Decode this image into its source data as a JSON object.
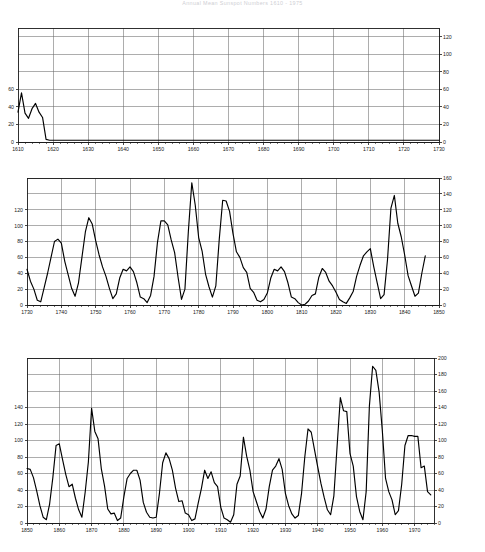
{
  "title": "Annual Mean Sunspot Numbers 1610 - 1975",
  "chart_data": [
    {
      "id": "panel-1",
      "type": "line",
      "title": "",
      "xlabel": "",
      "ylabel": "",
      "xlim": [
        1610,
        1730
      ],
      "ylim": [
        0,
        130
      ],
      "grid": true,
      "legend": null,
      "x_ticks": [
        1610,
        1620,
        1630,
        1640,
        1650,
        1660,
        1670,
        1680,
        1690,
        1700,
        1710,
        1720,
        1730
      ],
      "x_tick_labels": [
        "1610",
        "1620",
        "1630",
        "1640",
        "1650",
        "1660",
        "1670",
        "1680",
        "1690",
        "1700",
        "1710",
        "1720",
        "1730"
      ],
      "y_ticks_left": [
        0,
        20,
        40,
        60
      ],
      "y_tick_labels_left": [
        "0",
        "20",
        "40",
        "60"
      ],
      "y_ticks_right": [
        0,
        20,
        40,
        60,
        80,
        100,
        120
      ],
      "y_tick_labels_right": [
        "0",
        "20",
        "40",
        "60",
        "80",
        "100",
        "120"
      ],
      "x": [
        1610,
        1611,
        1612,
        1613,
        1614,
        1615,
        1616,
        1617,
        1618,
        1619,
        1620,
        1621,
        1622,
        1623,
        1624,
        1625,
        1626,
        1627,
        1628,
        1629,
        1630,
        1631,
        1632,
        1633,
        1634,
        1635,
        1636,
        1637,
        1638,
        1639,
        1640,
        1641,
        1642,
        1643,
        1644,
        1645,
        1646,
        1647,
        1648,
        1649,
        1650,
        1651,
        1652,
        1653,
        1654,
        1655,
        1656,
        1657,
        1658,
        1659,
        1660,
        1661,
        1662,
        1663,
        1664,
        1665,
        1666,
        1667,
        1668,
        1669,
        1670,
        1671,
        1672,
        1673,
        1674,
        1675,
        1676,
        1677,
        1678,
        1679,
        1680,
        1681,
        1682,
        1683,
        1684,
        1685,
        1686,
        1687,
        1688,
        1689,
        1690,
        1691,
        1692,
        1693,
        1694,
        1695,
        1696,
        1697,
        1698,
        1699,
        1700,
        1701,
        1702,
        1703,
        1704,
        1705,
        1706,
        1707,
        1708,
        1709,
        1710,
        1711,
        1712,
        1713,
        1714,
        1715,
        1716,
        1717,
        1718,
        1719,
        1720,
        1721,
        1722,
        1723,
        1724,
        1725,
        1726,
        1727,
        1728,
        1729,
        1730
      ],
      "y": [
        34,
        56,
        33,
        27,
        38,
        44,
        34,
        28,
        12,
        10,
        10,
        10,
        10,
        10,
        10,
        10,
        10,
        10,
        10,
        10,
        10,
        10,
        10,
        10,
        10,
        10,
        10,
        10,
        10,
        10,
        42,
        42,
        42,
        42,
        42,
        42,
        42,
        42,
        20,
        20,
        20,
        20,
        20,
        20,
        20,
        20,
        20,
        20,
        20,
        20,
        10,
        10,
        10,
        10,
        10,
        10,
        10,
        10,
        10,
        10,
        10,
        10,
        10,
        10,
        10,
        10,
        10,
        10,
        10,
        10,
        10,
        10,
        10,
        10,
        10,
        10,
        10,
        10,
        10,
        10,
        10,
        10,
        10,
        10,
        10,
        10,
        10,
        10,
        10,
        10,
        10,
        10,
        10,
        10,
        10,
        10,
        10,
        10,
        10,
        10,
        10,
        10,
        10,
        10,
        10,
        10,
        10,
        10,
        10,
        10,
        10,
        10,
        10,
        10,
        10,
        10,
        10,
        10,
        10,
        10,
        10
      ],
      "y_rendered": [
        34,
        56,
        33,
        27,
        38,
        44,
        34,
        28,
        3,
        2,
        2,
        2,
        2,
        2,
        2,
        2,
        2,
        2,
        2,
        2,
        2,
        2,
        2,
        2,
        2,
        2,
        2,
        2,
        2,
        2,
        2,
        2,
        2,
        2,
        2,
        2,
        2,
        2,
        2,
        2,
        2,
        2,
        2,
        2,
        2,
        2,
        2,
        2,
        2,
        2,
        2,
        2,
        2,
        2,
        2,
        2,
        2,
        2,
        2,
        2,
        2,
        2,
        2,
        2,
        2,
        2,
        2,
        2,
        2,
        2,
        2,
        2,
        2,
        2,
        2,
        2,
        2,
        2,
        2,
        2,
        2,
        2,
        2,
        2,
        2,
        2,
        2,
        2,
        2,
        2,
        2,
        2,
        2,
        2,
        2,
        2,
        2,
        2,
        2,
        2,
        2,
        2,
        2,
        2,
        2,
        2,
        2,
        2,
        2,
        2,
        2,
        2,
        2,
        2,
        2,
        2,
        2,
        2,
        2,
        2,
        2
      ]
    },
    {
      "id": "panel-2",
      "type": "line",
      "title": "",
      "xlabel": "",
      "ylabel": "",
      "xlim": [
        1730,
        1850
      ],
      "ylim": [
        0,
        160
      ],
      "grid": true,
      "legend": null,
      "x_ticks": [
        1730,
        1740,
        1750,
        1760,
        1770,
        1780,
        1790,
        1800,
        1810,
        1820,
        1830,
        1840,
        1850
      ],
      "x_tick_labels": [
        "1730",
        "1740",
        "1750",
        "1760",
        "1770",
        "1780",
        "1790",
        "1800",
        "1810",
        "1820",
        "1830",
        "1840",
        "1850"
      ],
      "y_ticks_left": [
        0,
        20,
        40,
        60,
        80,
        100,
        120
      ],
      "y_tick_labels_left": [
        "0",
        "20",
        "40",
        "60",
        "80",
        "100",
        "120"
      ],
      "y_ticks_right": [
        0,
        20,
        40,
        60,
        80,
        100,
        120,
        140,
        160
      ],
      "y_tick_labels_right": [
        "0",
        "20",
        "40",
        "60",
        "80",
        "100",
        "120",
        "140",
        "160"
      ],
      "x": [
        1730,
        1731,
        1732,
        1733,
        1734,
        1735,
        1736,
        1737,
        1738,
        1739,
        1740,
        1741,
        1742,
        1743,
        1744,
        1745,
        1746,
        1747,
        1748,
        1749,
        1750,
        1751,
        1752,
        1753,
        1754,
        1755,
        1756,
        1757,
        1758,
        1759,
        1760,
        1761,
        1762,
        1763,
        1764,
        1765,
        1766,
        1767,
        1768,
        1769,
        1770,
        1771,
        1772,
        1773,
        1774,
        1775,
        1776,
        1777,
        1778,
        1779,
        1780,
        1781,
        1782,
        1783,
        1784,
        1785,
        1786,
        1787,
        1788,
        1789,
        1790,
        1791,
        1792,
        1793,
        1794,
        1795,
        1796,
        1797,
        1798,
        1799,
        1800,
        1801,
        1802,
        1803,
        1804,
        1805,
        1806,
        1807,
        1808,
        1809,
        1810,
        1811,
        1812,
        1813,
        1814,
        1815,
        1816,
        1817,
        1818,
        1819,
        1820,
        1821,
        1822,
        1823,
        1824,
        1825,
        1826,
        1827,
        1828,
        1829,
        1830,
        1831,
        1832,
        1833,
        1834,
        1835,
        1836,
        1837,
        1838,
        1839,
        1840,
        1841,
        1842,
        1843,
        1844,
        1845,
        1846,
        1847,
        1848,
        1849,
        1850
      ],
      "y": [
        45,
        30,
        20,
        6,
        4,
        22,
        40,
        60,
        80,
        83,
        78,
        55,
        38,
        21,
        11,
        28,
        60,
        92,
        110,
        102,
        81,
        63,
        48,
        36,
        21,
        8,
        14,
        34,
        45,
        43,
        48,
        42,
        28,
        10,
        8,
        3,
        12,
        36,
        79,
        106,
        106,
        101,
        82,
        66,
        35,
        7,
        20,
        93,
        154,
        126,
        85,
        68,
        39,
        23,
        10,
        24,
        83,
        132,
        131,
        118,
        90,
        67,
        60,
        47,
        41,
        21,
        16,
        6,
        4,
        7,
        15,
        34,
        45,
        43,
        48,
        42,
        28,
        10,
        8,
        3,
        0,
        1,
        5,
        12,
        14,
        35,
        46,
        41,
        30,
        24,
        16,
        7,
        4,
        2,
        9,
        17,
        36,
        50,
        62,
        67,
        71,
        48,
        28,
        8,
        13,
        57,
        122,
        138,
        103,
        86,
        63,
        37,
        24,
        11,
        15,
        40,
        62
      ],
      "y_rendered": [
        45,
        30,
        20,
        6,
        4,
        22,
        40,
        60,
        80,
        83,
        78,
        55,
        38,
        21,
        11,
        28,
        60,
        92,
        110,
        102,
        81,
        63,
        48,
        36,
        21,
        8,
        14,
        34,
        45,
        43,
        48,
        42,
        28,
        10,
        8,
        3,
        12,
        36,
        79,
        106,
        106,
        101,
        82,
        66,
        35,
        7,
        20,
        93,
        154,
        126,
        85,
        68,
        39,
        23,
        10,
        24,
        83,
        132,
        131,
        118,
        90,
        67,
        60,
        47,
        41,
        21,
        16,
        6,
        4,
        7,
        15,
        34,
        45,
        43,
        48,
        42,
        28,
        10,
        8,
        3,
        0,
        1,
        5,
        12,
        14,
        35,
        46,
        41,
        30,
        24,
        16,
        7,
        4,
        2,
        9,
        17,
        36,
        50,
        62,
        67,
        71,
        48,
        28,
        8,
        13,
        57,
        122,
        138,
        103,
        86,
        63,
        37,
        24,
        11,
        15,
        40,
        62
      ]
    },
    {
      "id": "panel-3",
      "type": "line",
      "title": "",
      "xlabel": "",
      "ylabel": "",
      "xlim": [
        1850,
        1976
      ],
      "ylim": [
        0,
        200
      ],
      "grid": true,
      "legend": null,
      "x_ticks": [
        1850,
        1860,
        1870,
        1880,
        1890,
        1900,
        1910,
        1920,
        1930,
        1940,
        1950,
        1960,
        1970
      ],
      "x_tick_labels": [
        "1850",
        "1860",
        "1870",
        "1880",
        "1890",
        "1900",
        "1910",
        "1920",
        "1930",
        "1940",
        "1950",
        "1960",
        "1970"
      ],
      "y_ticks_left": [
        0,
        20,
        40,
        60,
        80,
        100,
        120,
        140
      ],
      "y_tick_labels_left": [
        "0",
        "20",
        "40",
        "60",
        "80",
        "100",
        "120",
        "140"
      ],
      "y_ticks_right": [
        0,
        20,
        40,
        60,
        80,
        100,
        120,
        140,
        160,
        180,
        200
      ],
      "y_tick_labels_right": [
        "0",
        "20",
        "40",
        "60",
        "80",
        "100",
        "120",
        "140",
        "160",
        "180",
        "200"
      ],
      "x": [
        1850,
        1851,
        1852,
        1853,
        1854,
        1855,
        1856,
        1857,
        1858,
        1859,
        1860,
        1861,
        1862,
        1863,
        1864,
        1865,
        1866,
        1867,
        1868,
        1869,
        1870,
        1871,
        1872,
        1873,
        1874,
        1875,
        1876,
        1877,
        1878,
        1879,
        1880,
        1881,
        1882,
        1883,
        1884,
        1885,
        1886,
        1887,
        1888,
        1889,
        1890,
        1891,
        1892,
        1893,
        1894,
        1895,
        1896,
        1897,
        1898,
        1899,
        1900,
        1901,
        1902,
        1903,
        1904,
        1905,
        1906,
        1907,
        1908,
        1909,
        1910,
        1911,
        1912,
        1913,
        1914,
        1915,
        1916,
        1917,
        1918,
        1919,
        1920,
        1921,
        1922,
        1923,
        1924,
        1925,
        1926,
        1927,
        1928,
        1929,
        1930,
        1931,
        1932,
        1933,
        1934,
        1935,
        1936,
        1937,
        1938,
        1939,
        1940,
        1941,
        1942,
        1943,
        1944,
        1945,
        1946,
        1947,
        1948,
        1949,
        1950,
        1951,
        1952,
        1953,
        1954,
        1955,
        1956,
        1957,
        1958,
        1959,
        1960,
        1961,
        1962,
        1963,
        1964,
        1965,
        1966,
        1967,
        1968,
        1969,
        1970,
        1971,
        1972,
        1973,
        1974,
        1975
      ],
      "y": [
        66,
        65,
        55,
        39,
        21,
        7,
        4,
        23,
        55,
        94,
        96,
        77,
        59,
        44,
        47,
        30,
        16,
        7,
        37,
        74,
        139,
        111,
        102,
        66,
        45,
        17,
        11,
        12,
        3,
        6,
        32,
        54,
        60,
        64,
        64,
        52,
        25,
        13,
        7,
        6,
        7,
        36,
        73,
        85,
        78,
        64,
        42,
        26,
        27,
        12,
        10,
        3,
        5,
        24,
        42,
        64,
        54,
        62,
        49,
        44,
        19,
        6,
        4,
        1,
        10,
        47,
        57,
        104,
        81,
        64,
        38,
        26,
        14,
        6,
        17,
        44,
        64,
        69,
        78,
        65,
        36,
        21,
        11,
        6,
        9,
        36,
        80,
        114,
        110,
        89,
        68,
        48,
        31,
        16,
        10,
        33,
        93,
        152,
        136,
        135,
        84,
        69,
        32,
        14,
        4,
        38,
        142,
        190,
        185,
        159,
        112,
        54,
        38,
        28,
        10,
        15,
        47,
        94,
        106,
        106,
        105,
        105,
        67,
        69,
        38,
        34,
        16,
        13,
        29,
        38,
        35,
        16
      ]
    }
  ]
}
